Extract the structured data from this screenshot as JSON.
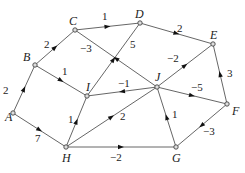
{
  "diagram": {
    "type": "directed weighted graph",
    "nodes": [
      {
        "id": "A",
        "x": 13,
        "y": 113,
        "lx": 5,
        "ly": 121
      },
      {
        "id": "B",
        "x": 35,
        "y": 65,
        "lx": 23,
        "ly": 61
      },
      {
        "id": "C",
        "x": 75,
        "y": 30,
        "lx": 69,
        "ly": 25
      },
      {
        "id": "D",
        "x": 140,
        "y": 23,
        "lx": 135,
        "ly": 18
      },
      {
        "id": "E",
        "x": 213,
        "y": 44,
        "lx": 210,
        "ly": 39
      },
      {
        "id": "F",
        "x": 227,
        "y": 104,
        "lx": 232,
        "ly": 115
      },
      {
        "id": "G",
        "x": 176,
        "y": 147,
        "lx": 172,
        "ly": 162
      },
      {
        "id": "H",
        "x": 66,
        "y": 147,
        "lx": 62,
        "ly": 162
      },
      {
        "id": "I",
        "x": 87,
        "y": 96,
        "lx": 86,
        "ly": 91
      },
      {
        "id": "J",
        "x": 157,
        "y": 87,
        "lx": 155,
        "ly": 81
      }
    ],
    "edges": [
      {
        "from": "A",
        "to": "B",
        "weight": "2",
        "lx": 3,
        "ly": 94
      },
      {
        "from": "B",
        "to": "C",
        "weight": "2",
        "lx": 44,
        "ly": 48
      },
      {
        "from": "C",
        "to": "D",
        "weight": "1",
        "lx": 102,
        "ly": 20
      },
      {
        "from": "D",
        "to": "E",
        "weight": "2",
        "lx": 177,
        "ly": 32
      },
      {
        "from": "B",
        "to": "I",
        "weight": "1",
        "lx": 62,
        "ly": 75
      },
      {
        "from": "J",
        "to": "C",
        "weight": "−3",
        "lx": 80,
        "ly": 52
      },
      {
        "from": "I",
        "to": "D",
        "weight": "5",
        "lx": 130,
        "ly": 48
      },
      {
        "from": "J",
        "to": "I",
        "weight": "−1",
        "lx": 118,
        "ly": 87
      },
      {
        "from": "H",
        "to": "I",
        "weight": "1",
        "lx": 68,
        "ly": 123
      },
      {
        "from": "A",
        "to": "H",
        "weight": "7",
        "lx": 35,
        "ly": 142
      },
      {
        "from": "H",
        "to": "J",
        "weight": "2",
        "lx": 120,
        "ly": 120
      },
      {
        "from": "H",
        "to": "G",
        "weight": "−2",
        "lx": 110,
        "ly": 161
      },
      {
        "from": "G",
        "to": "J",
        "weight": "1",
        "lx": 172,
        "ly": 118
      },
      {
        "from": "F",
        "to": "G",
        "weight": "−3",
        "lx": 203,
        "ly": 135
      },
      {
        "from": "F",
        "to": "E",
        "weight": "3",
        "lx": 227,
        "ly": 77
      },
      {
        "from": "J",
        "to": "E",
        "weight": "−2",
        "lx": 167,
        "ly": 62
      },
      {
        "from": "J",
        "to": "F",
        "weight": "−5",
        "lx": 191,
        "ly": 91
      }
    ]
  }
}
